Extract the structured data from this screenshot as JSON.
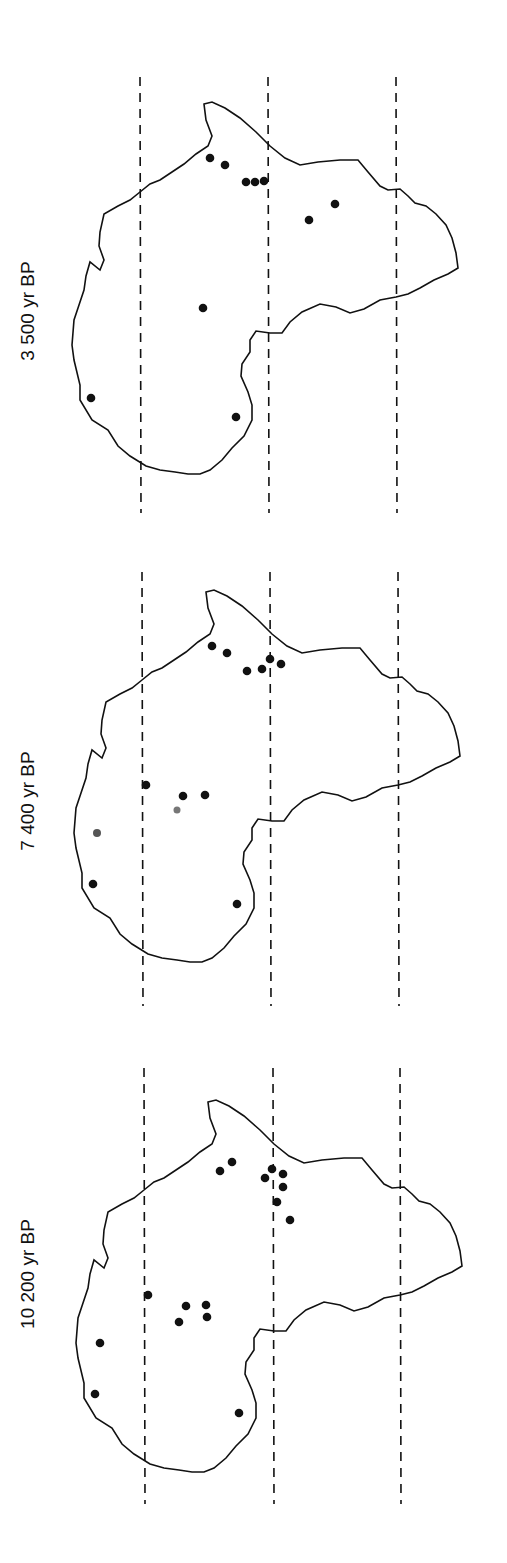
{
  "figure": {
    "colors": {
      "outline": "#111111",
      "dots": "#111111",
      "dashes": "#111111",
      "background": "#ffffff"
    },
    "panels": [
      {
        "label": "3 500 yr BP",
        "offset_y": 0,
        "dash_x": [
          140,
          268,
          396
        ],
        "dash_y": [
          77,
          513
        ],
        "dots": [
          [
            210,
            158
          ],
          [
            225,
            165
          ],
          [
            246,
            182
          ],
          [
            255,
            182
          ],
          [
            264,
            181
          ],
          [
            309,
            220
          ],
          [
            335,
            204
          ],
          [
            203,
            308
          ],
          [
            91,
            398
          ],
          [
            236,
            417
          ]
        ]
      },
      {
        "label": "7 400 yr BP",
        "offset_y": 520,
        "dash_x": [
          142,
          270,
          398
        ],
        "dash_y": [
          572,
          1006
        ],
        "dots": [
          [
            212,
            646
          ],
          [
            227,
            653
          ],
          [
            247,
            671
          ],
          [
            262,
            669
          ],
          [
            270,
            659
          ],
          [
            281,
            664
          ],
          [
            146,
            785
          ],
          [
            183,
            796
          ],
          [
            205,
            795
          ],
          [
            177,
            810
          ],
          [
            97,
            833
          ],
          [
            93,
            884
          ],
          [
            237,
            904
          ]
        ]
      },
      {
        "label": "10 200 yr BP",
        "offset_y": 1040,
        "dash_x": [
          144,
          273,
          400
        ],
        "dash_y": [
          1068,
          1504
        ],
        "dots": [
          [
            220,
            1171
          ],
          [
            232,
            1162
          ],
          [
            265,
            1178
          ],
          [
            272,
            1169
          ],
          [
            283,
            1174
          ],
          [
            283,
            1187
          ],
          [
            277,
            1202
          ],
          [
            290,
            1220
          ],
          [
            148,
            1295
          ],
          [
            186,
            1306
          ],
          [
            206,
            1305
          ],
          [
            179,
            1322
          ],
          [
            207,
            1317
          ],
          [
            100,
            1343
          ],
          [
            95,
            1394
          ],
          [
            239,
            1413
          ]
        ]
      }
    ]
  }
}
